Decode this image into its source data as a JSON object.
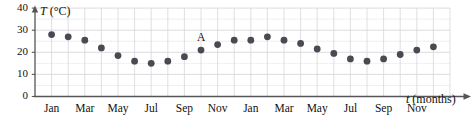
{
  "chart_data": {
    "type": "scatter",
    "title": "",
    "xlabel": "t (months)",
    "ylabel": "T (°C)",
    "xlim": [
      0,
      25
    ],
    "ylim": [
      0,
      40
    ],
    "yticks": [
      0,
      10,
      20,
      30,
      40
    ],
    "ytick_labels": [
      "0",
      "10",
      "20",
      "30",
      "40"
    ],
    "xtick_labels": [
      "Jan",
      "Mar",
      "May",
      "Jul",
      "Sep",
      "Nov",
      "Jan",
      "Mar",
      "May",
      "Jul",
      "Sep",
      "Nov"
    ],
    "xtick_positions": [
      1,
      3,
      5,
      7,
      9,
      11,
      13,
      15,
      17,
      19,
      21,
      23
    ],
    "grid": true,
    "grid_color": "#d8d8dc",
    "axis_color": "#555558",
    "marker_color": "#4a4a52",
    "marker_size": 3.4,
    "x": [
      1,
      2,
      3,
      4,
      5,
      6,
      7,
      8,
      9,
      10,
      11,
      12,
      13,
      14,
      15,
      16,
      17,
      18,
      19,
      20,
      21,
      22,
      23,
      24
    ],
    "y": [
      28,
      27,
      25.5,
      22,
      18.5,
      16,
      15,
      16,
      18,
      21,
      23.5,
      25.5,
      25.5,
      27,
      25.5,
      24,
      21.5,
      19.5,
      17,
      16,
      17,
      19,
      21,
      22.5
    ],
    "series": [
      {
        "name": "Monthly mean temperature",
        "values": [
          28,
          27,
          25.5,
          22,
          18.5,
          16,
          15,
          16,
          18,
          21,
          23.5,
          25.5,
          25.5,
          27,
          25.5,
          24,
          21.5,
          19.5,
          17,
          16,
          17,
          19,
          21,
          22.5
        ]
      }
    ],
    "annotations": [
      {
        "label": "A",
        "x": 10,
        "y": 21,
        "describes": "point at month 10, 21 °C"
      }
    ]
  },
  "axis": {
    "y_title_symbol": "T",
    "y_title_unit": " (°C)",
    "x_title_symbol": "t",
    "x_title_unit": " (months)"
  }
}
